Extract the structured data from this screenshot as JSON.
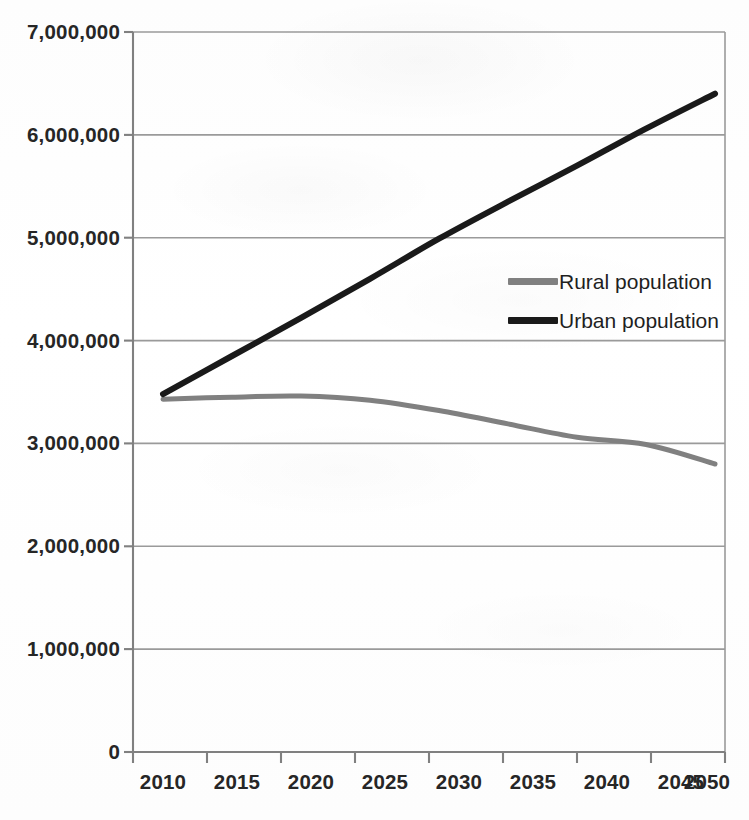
{
  "chart_data": {
    "type": "line",
    "title": "",
    "subtitle": "",
    "xlabel": "",
    "ylabel": "",
    "x": [
      2010,
      2015,
      2020,
      2025,
      2030,
      2035,
      2040,
      2045,
      2050
    ],
    "xtick_labels": [
      "2010",
      "2015",
      "2020",
      "2025",
      "2030",
      "2035",
      "2040",
      "2045",
      "2050"
    ],
    "ytick_labels": [
      "0",
      "1,000,000",
      "2,000,000",
      "3,000,000",
      "4,000,000",
      "5,000,000",
      "6,000,000",
      "7,000,000"
    ],
    "ytick_values": [
      0,
      1000000,
      2000000,
      3000000,
      4000000,
      5000000,
      6000000,
      7000000
    ],
    "ylim": [
      0,
      7000000
    ],
    "grid": "horizontal",
    "legend_position": "inside-right",
    "series": [
      {
        "name": "Rural population",
        "color": "#808080",
        "line_width": 5,
        "values": [
          3430000,
          3450000,
          3460000,
          3420000,
          3320000,
          3190000,
          3060000,
          2990000,
          2800000
        ]
      },
      {
        "name": "Urban population",
        "color": "#1a1a1a",
        "line_width": 6,
        "values": [
          3480000,
          3850000,
          4220000,
          4600000,
          4990000,
          5350000,
          5700000,
          6060000,
          6400000
        ]
      }
    ]
  },
  "legend": {
    "items": [
      {
        "label": "Rural population",
        "color": "#808080"
      },
      {
        "label": "Urban population",
        "color": "#1a1a1a"
      }
    ]
  },
  "axes": {
    "axis_color": "#808080",
    "grid_color": "#9a9a9a",
    "tick_label_color": "#262626"
  }
}
